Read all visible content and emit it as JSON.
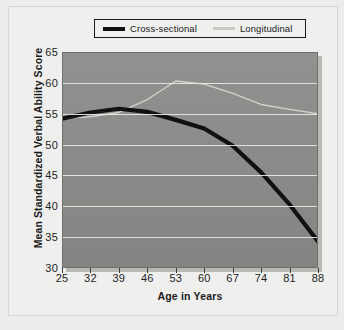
{
  "legend": {
    "entries": [
      {
        "label": "Cross-sectional",
        "color": "#111111",
        "style": "thick-black"
      },
      {
        "label": "Longitudinal",
        "color": "#c9c9c6",
        "style": "thin-light"
      }
    ]
  },
  "axes": {
    "y_title": "Mean Standardized Verbal Ability Score",
    "x_title": "Age in Years",
    "y_ticks": [
      30,
      35,
      40,
      45,
      50,
      55,
      60,
      65
    ],
    "x_ticks": [
      25,
      32,
      39,
      46,
      53,
      60,
      67,
      74,
      81,
      88
    ]
  },
  "colors": {
    "plot_background": "#8d8d8b",
    "gridline": "#e8e8e6",
    "page_background": "#efefee",
    "cross_sectional": "#111111",
    "longitudinal": "#c9c9c6",
    "text": "#1b1b1b"
  },
  "chart_data": {
    "type": "line",
    "title": "",
    "xlabel": "Age in Years",
    "ylabel": "Mean Standardized Verbal Ability Score",
    "xlim": [
      25,
      88
    ],
    "ylim": [
      30,
      65
    ],
    "grid": true,
    "legend_position": "top",
    "x": [
      25,
      32,
      39,
      46,
      53,
      60,
      67,
      74,
      81,
      88
    ],
    "series": [
      {
        "name": "Cross-sectional",
        "values": [
          54.2,
          55.2,
          55.8,
          55.3,
          54.0,
          52.6,
          49.8,
          45.5,
          40.3,
          34.3
        ]
      },
      {
        "name": "Longitudinal",
        "values": [
          54.3,
          54.5,
          55.2,
          57.3,
          60.3,
          59.8,
          58.3,
          56.5,
          55.7,
          55.0
        ]
      }
    ]
  }
}
